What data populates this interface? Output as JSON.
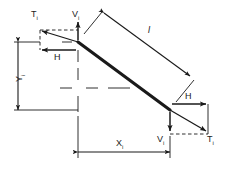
{
  "figure": {
    "background_color": "#ffffff",
    "line_color": "#1a1a1a",
    "member_color": "#1a1a1a"
  },
  "labels": {
    "tension_top": {
      "symbol": "T",
      "subscript": "i"
    },
    "shear_top": {
      "symbol": "V",
      "subscript": "i"
    },
    "horizontal_top": {
      "symbol": "H",
      "subscript": ""
    },
    "length": {
      "symbol": "l",
      "subscript": ""
    },
    "vertical_projection": {
      "symbol": "Y",
      "subscript": "i"
    },
    "horizontal_projection": {
      "symbol": "X",
      "subscript": "i"
    },
    "horizontal_bottom": {
      "symbol": "H",
      "subscript": ""
    },
    "shear_bottom": {
      "symbol": "V",
      "subscript": "i"
    },
    "tension_bottom": {
      "symbol": "T",
      "subscript": "i"
    }
  },
  "geometry": {
    "member_start": {
      "x": 78,
      "y": 42
    },
    "member_end": {
      "x": 170,
      "y": 110
    },
    "x_dimension_left": 78,
    "x_dimension_right": 170,
    "x_dimension_y": 152,
    "y_dimension_x": 18,
    "y_dimension_top": 42,
    "y_dimension_bottom": 110
  }
}
